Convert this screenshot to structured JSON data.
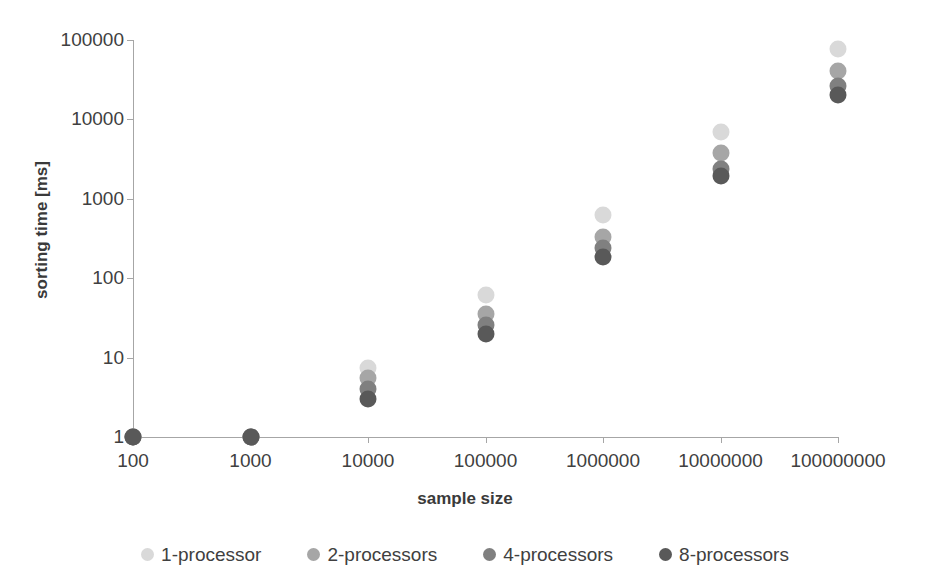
{
  "chart_data": {
    "type": "scatter",
    "title": "",
    "xlabel": "sample size",
    "ylabel": "sorting time [ms]",
    "x_scale": "log",
    "y_scale": "log",
    "xlim": [
      100,
      100000000
    ],
    "ylim": [
      1,
      100000
    ],
    "grid": false,
    "legend_position": "bottom",
    "x_tick_labels": [
      "100",
      "1000",
      "10000",
      "100000",
      "1000000",
      "10000000",
      "100000000"
    ],
    "y_tick_labels": [
      "1",
      "10",
      "100",
      "1000",
      "10000",
      "100000"
    ],
    "categories": [
      100,
      1000,
      10000,
      100000,
      1000000,
      10000000,
      100000000
    ],
    "series": [
      {
        "name": "1-processor",
        "color": "#d9d9d9",
        "values": [
          1,
          1,
          7.5,
          62,
          620,
          7000,
          78000
        ]
      },
      {
        "name": "2-processors",
        "color": "#a6a6a6",
        "values": [
          1,
          1,
          5.5,
          35,
          330,
          3800,
          41000
        ]
      },
      {
        "name": "4-processors",
        "color": "#808080",
        "values": [
          1,
          1,
          4,
          26,
          240,
          2400,
          26000
        ]
      },
      {
        "name": "8-processors",
        "color": "#595959",
        "values": [
          1,
          1,
          3,
          20,
          185,
          1950,
          20000
        ]
      }
    ]
  },
  "legend": {
    "items": [
      {
        "label": "1-processor",
        "color": "#d9d9d9"
      },
      {
        "label": "2-processors",
        "color": "#a6a6a6"
      },
      {
        "label": "4-processors",
        "color": "#808080"
      },
      {
        "label": "8-processors",
        "color": "#595959"
      }
    ]
  },
  "axes": {
    "x_title": "sample size",
    "y_title": "sorting time [ms]"
  },
  "colors": {
    "axis": "#a6a6a6",
    "text": "#404040",
    "background": "#ffffff"
  }
}
